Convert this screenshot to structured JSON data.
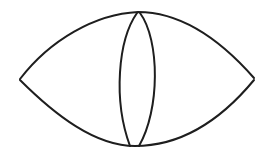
{
  "diagram": {
    "stroke_color": "#1e1e1e",
    "background": "#ffffff",
    "outer_lens": {
      "left_tip": [
        20,
        79
      ],
      "right_tip": [
        254,
        79
      ],
      "top": [
        140,
        12
      ],
      "bottom": [
        135,
        146
      ]
    },
    "inner_lens": {
      "top": [
        138,
        13
      ],
      "bottom": [
        135,
        146
      ],
      "left_extent": 116,
      "right_extent": 157
    }
  }
}
